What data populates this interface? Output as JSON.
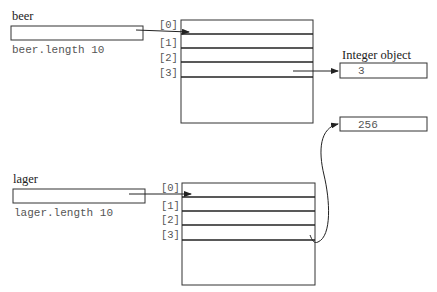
{
  "diagram": {
    "arrays": [
      {
        "variable": "beer",
        "length_label": "beer.length 10",
        "indices": [
          "[0]",
          "[1]",
          "[2]",
          "[3]"
        ]
      },
      {
        "variable": "lager",
        "length_label": "lager.length 10",
        "indices": [
          "[0]",
          "[1]",
          "[2]",
          "[3]"
        ]
      }
    ],
    "objects": {
      "heading": "Integer object",
      "values": [
        "3",
        "256"
      ]
    },
    "edges": [
      {
        "from": "beer",
        "to": "beer[0]"
      },
      {
        "from": "lager",
        "to": "lager[0]"
      },
      {
        "from": "beer[3]",
        "to": "3"
      },
      {
        "from": "lager[3]",
        "to": "256"
      }
    ]
  }
}
